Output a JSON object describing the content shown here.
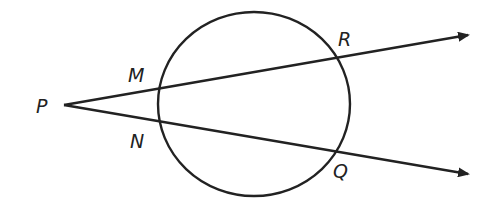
{
  "diagram": {
    "type": "secants from external point to circle",
    "points": {
      "P": "P",
      "M": "M",
      "N": "N",
      "R": "R",
      "Q": "Q"
    },
    "stroke_color": "#222222",
    "background": "#ffffff"
  }
}
